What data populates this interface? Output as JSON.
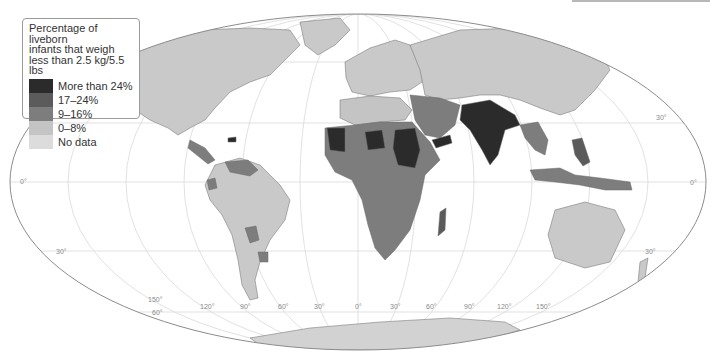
{
  "legend": {
    "title_lines": [
      "Percentage of liveborn",
      "infants that weigh",
      "less than 2.5 kg/5.5 lbs"
    ],
    "items": [
      {
        "label": "More than 24%",
        "color": "#2b2b2b"
      },
      {
        "label": "17–24%",
        "color": "#5b5b5b"
      },
      {
        "label": "9–16%",
        "color": "#7d7d7d"
      },
      {
        "label": "0–8%",
        "color": "#c4c4c4"
      },
      {
        "label": "No data",
        "color": "#dcdcdc"
      }
    ]
  },
  "graticule": {
    "latitude_labels": {
      "left_0": "0°",
      "left_30s": "30°",
      "left_60s": "60°",
      "right_30n": "30°",
      "right_0": "0°",
      "right_30s": "30°"
    },
    "longitude_labels": [
      "150°",
      "120°",
      "90°",
      "60°",
      "30°",
      "0°",
      "30°",
      "60°",
      "90°",
      "120°",
      "150°"
    ]
  },
  "colors": {
    "ocean": "#ffffff",
    "graticule": "#d6d6d6",
    "outline": "#8c8c8c",
    "border": "#555555"
  }
}
